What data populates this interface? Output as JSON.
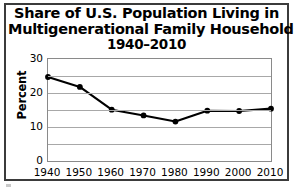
{
  "chart_data": {
    "type": "line",
    "title": "Share of U.S. Population Living in Multigenerational Family Households 1940–2010",
    "title_lines": [
      "Share of U.S. Population Living in",
      "Multigenerational Family Households",
      "1940–2010"
    ],
    "xlabel": "",
    "ylabel": "Percent",
    "categories": [
      1940,
      1950,
      1960,
      1970,
      1980,
      1990,
      2000,
      2010
    ],
    "x_tick_labels": [
      "1940",
      "1950",
      "1960",
      "1970",
      "1980",
      "1990",
      "2000",
      "2010"
    ],
    "values": [
      24.7,
      21.8,
      15.1,
      13.4,
      11.6,
      14.8,
      14.7,
      15.4
    ],
    "series": [
      {
        "name": "Share of U.S. population in multigenerational households",
        "values": [
          24.7,
          21.8,
          15.1,
          13.4,
          11.6,
          14.8,
          14.7,
          15.4
        ]
      }
    ],
    "ylim": [
      0,
      30
    ],
    "xlim": [
      1940,
      2010
    ],
    "y_tick_labels": [
      "0",
      "10",
      "20",
      "30"
    ],
    "y_tick_values": [
      0,
      10,
      20,
      30
    ],
    "gridline_values": [
      0,
      5,
      10,
      15,
      20,
      25,
      30
    ],
    "grid": true,
    "grid_axis": "y",
    "legend": false,
    "legend_position": "none",
    "marker": "filled-circle",
    "line_color": "#000000",
    "marker_color": "#000000",
    "grid_color": "#a8a8a8",
    "frame_color": "#8a8a8a",
    "background_color": "#ffffff",
    "units": "percent"
  },
  "figure": {
    "outer_border_color": "#3b3b3b"
  }
}
